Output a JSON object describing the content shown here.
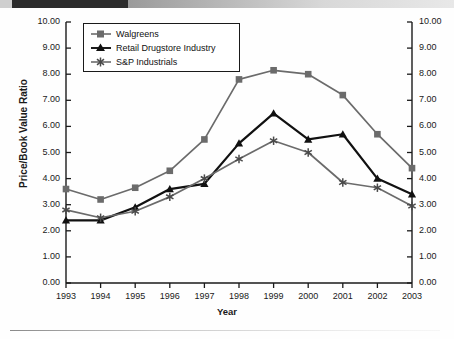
{
  "banner": {
    "label": ""
  },
  "chart_data": {
    "type": "line",
    "title": "",
    "xlabel": "Year",
    "ylabel": "Price/Book Value Ratio",
    "categories": [
      "1993",
      "1994",
      "1995",
      "1996",
      "1997",
      "1998",
      "1999",
      "2000",
      "2001",
      "2002",
      "2003"
    ],
    "ylim": [
      0,
      10
    ],
    "ytick_labels": [
      "10.00",
      "9.00",
      "8.00",
      "7.00",
      "6.00",
      "5.00",
      "4.00",
      "3.00",
      "2.00",
      "1.00",
      "0.00"
    ],
    "ytick_values": [
      10,
      9,
      8,
      7,
      6,
      5,
      4,
      3,
      2,
      1,
      0
    ],
    "dual_axis": true,
    "grid": false,
    "legend_position": "top-left",
    "series": [
      {
        "name": "Walgreens",
        "marker": "square",
        "color": "#6b6b6b",
        "values": [
          3.6,
          3.2,
          3.65,
          4.3,
          5.5,
          7.8,
          8.15,
          8.0,
          7.2,
          5.7,
          4.4
        ]
      },
      {
        "name": "Retail Drugstore Industry",
        "marker": "triangle",
        "color": "#111111",
        "values": [
          2.4,
          2.4,
          2.9,
          3.6,
          3.8,
          5.35,
          6.5,
          5.5,
          5.7,
          4.0,
          3.4
        ]
      },
      {
        "name": "S&P Industrials",
        "marker": "asterisk",
        "color": "#6b6b6b",
        "values": [
          2.8,
          2.5,
          2.75,
          3.3,
          4.0,
          4.75,
          5.45,
          5.0,
          3.85,
          3.65,
          2.95
        ]
      }
    ]
  }
}
